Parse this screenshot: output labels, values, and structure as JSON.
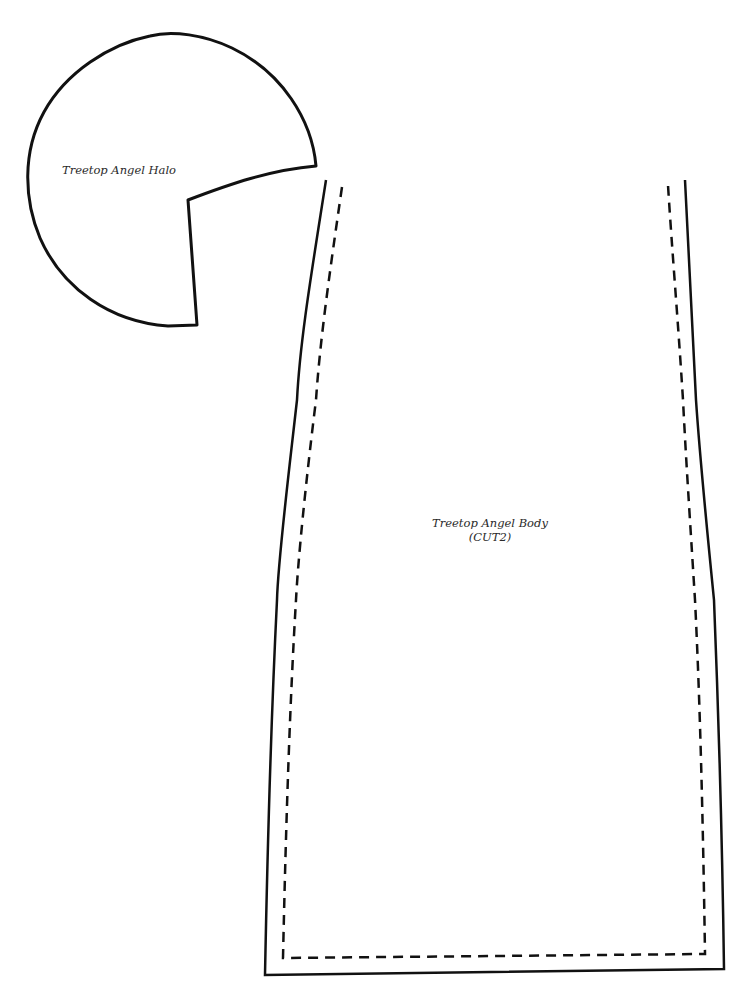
{
  "halo": {
    "label": "Treetop Angel Halo",
    "stroke_color": "#111111"
  },
  "body_piece": {
    "label_line1": "Treetop Angel Body",
    "label_line2": "(CUT2)",
    "cut_line": "solid",
    "seam_line": "dashed",
    "stroke_color": "#111111"
  }
}
